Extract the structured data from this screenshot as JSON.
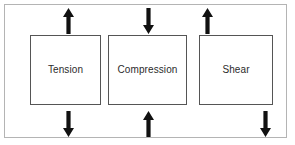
{
  "figure": {
    "background_color": "#ffffff",
    "frame_color": "#b4b4b4",
    "box_border_color": "#555555",
    "arrow_color": "#111111",
    "label_color": "#2b2b2b"
  },
  "boxes": [
    {
      "id": "tension",
      "label": "Tension",
      "arrows": [
        {
          "name": "tension-top-arrow",
          "direction": "up",
          "position": "top-center"
        },
        {
          "name": "tension-bottom-arrow",
          "direction": "down",
          "position": "bottom-center"
        }
      ]
    },
    {
      "id": "compression",
      "label": "Compression",
      "arrows": [
        {
          "name": "compression-top-arrow",
          "direction": "down",
          "position": "top-center"
        },
        {
          "name": "compression-bottom-arrow",
          "direction": "up",
          "position": "bottom-center"
        }
      ]
    },
    {
      "id": "shear",
      "label": "Shear",
      "arrows": [
        {
          "name": "shear-top-arrow",
          "direction": "up",
          "position": "top-left"
        },
        {
          "name": "shear-bottom-arrow",
          "direction": "down",
          "position": "bottom-right"
        }
      ]
    }
  ]
}
